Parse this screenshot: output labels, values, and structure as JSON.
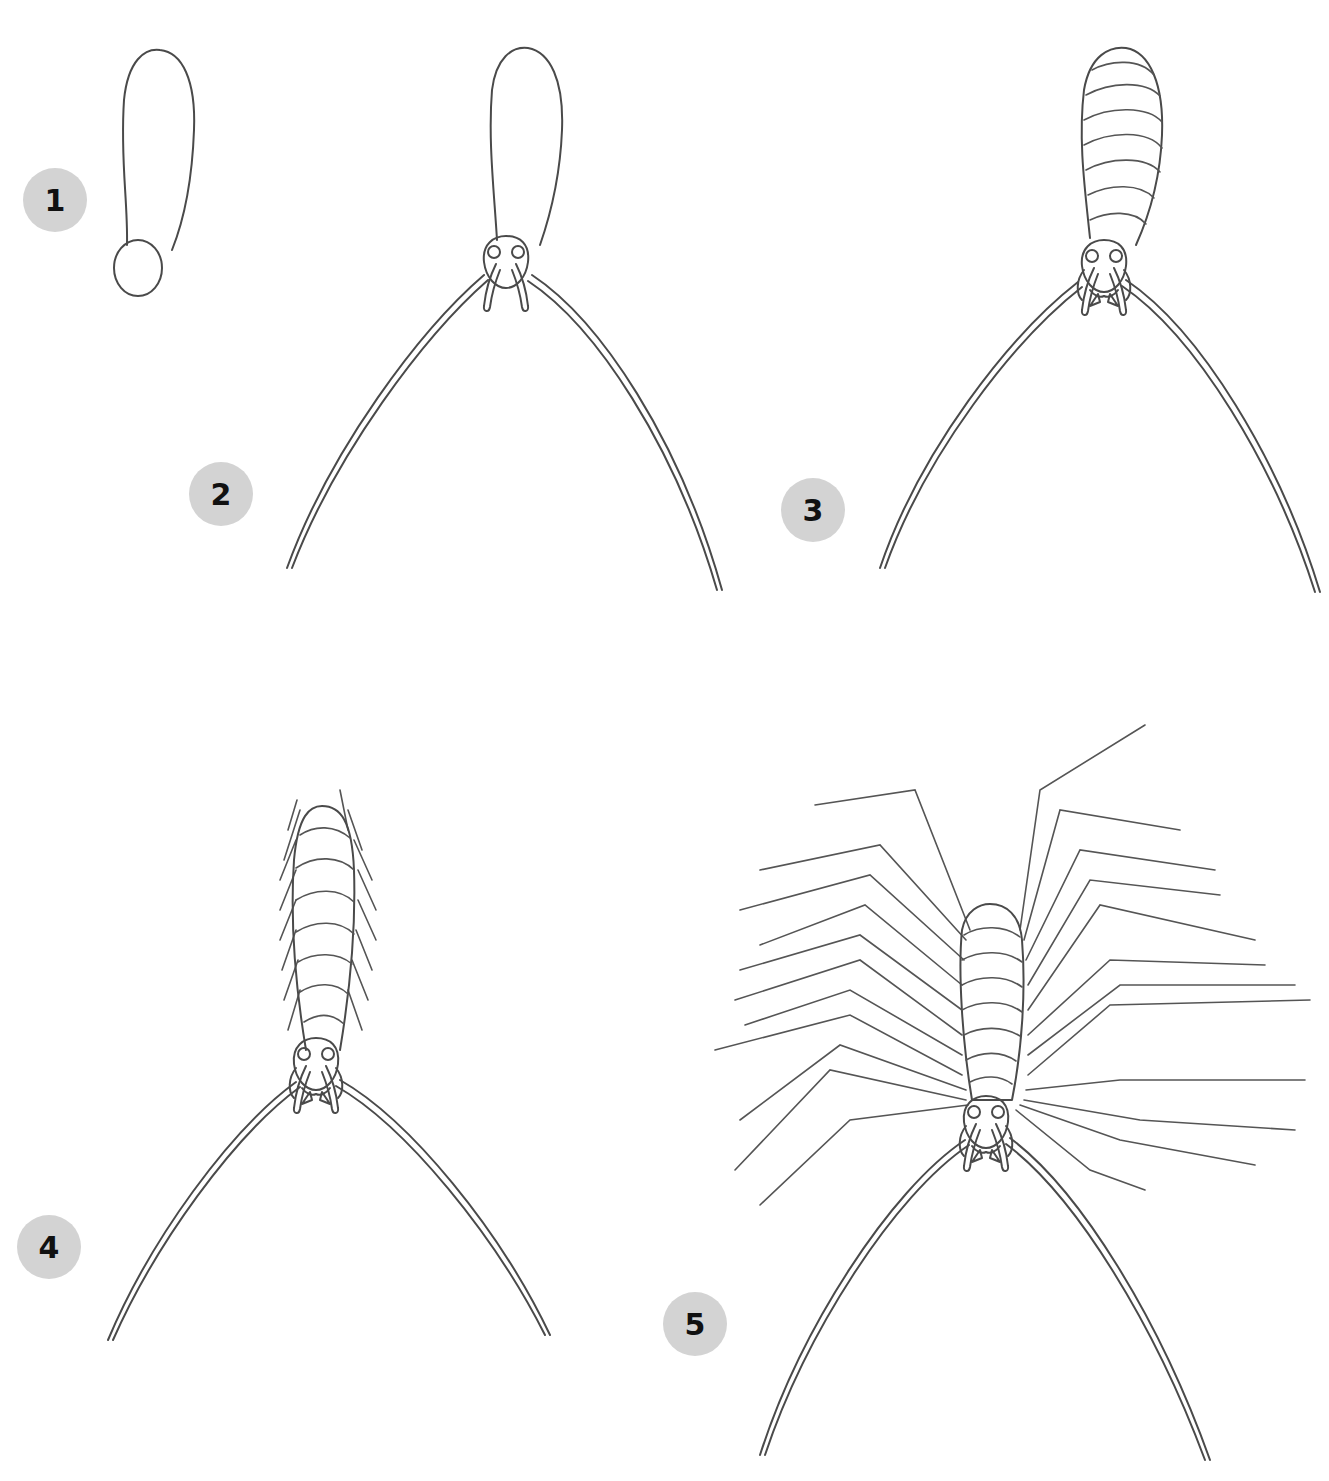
{
  "accent_color": "#d3d3d3",
  "line_color": "#4a4a4a",
  "steps": [
    {
      "number": "1",
      "description": "Body oval and head circle"
    },
    {
      "number": "2",
      "description": "Head with eyes, palps and long antennae"
    },
    {
      "number": "3",
      "description": "Body segments and mouthparts"
    },
    {
      "number": "4",
      "description": "Short leg stubs along the body"
    },
    {
      "number": "5",
      "description": "Long jointed legs"
    }
  ]
}
